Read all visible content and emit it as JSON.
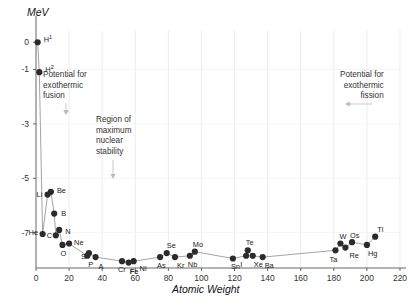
{
  "chart_data": {
    "type": "scatter",
    "title": "",
    "xlabel": "Atomic Weight",
    "ylabel": "MeV",
    "xlim": [
      0,
      220
    ],
    "ylim": [
      -8.3,
      0.45
    ],
    "xticks": [
      0,
      20,
      40,
      60,
      80,
      100,
      120,
      140,
      160,
      180,
      200,
      220
    ],
    "yticks": [
      0,
      -1,
      -3,
      -5,
      -7
    ],
    "ytick_labels": [
      "0",
      "-1",
      "-3",
      "-5",
      "-7"
    ],
    "grid": true,
    "legend": null,
    "line_color": "#9a9a9a",
    "marker_color": "#2b2b2b",
    "points": [
      {
        "label": "H",
        "sup": "1",
        "x": 1,
        "y": 0.0,
        "lx": 6,
        "ly": -4
      },
      {
        "label": "H",
        "sup": "2",
        "x": 2,
        "y": -1.1,
        "lx": 6,
        "ly": -4
      },
      {
        "label": "He",
        "x": 4,
        "y": -7.05,
        "lx": -14,
        "ly": -2
      },
      {
        "label": "Li",
        "x": 7,
        "y": -5.6,
        "lx": -11,
        "ly": -1
      },
      {
        "label": "Be",
        "x": 9,
        "y": -5.5,
        "lx": 6,
        "ly": -2
      },
      {
        "label": "B",
        "x": 11,
        "y": -6.3,
        "lx": 7,
        "ly": -1
      },
      {
        "label": "C",
        "x": 12,
        "y": -7.1,
        "lx": -9,
        "ly": 0
      },
      {
        "label": "N",
        "x": 14,
        "y": -6.9,
        "lx": 6,
        "ly": 1
      },
      {
        "label": "O",
        "x": 16,
        "y": -7.45,
        "lx": -2,
        "ly": 8
      },
      {
        "label": "Ne",
        "x": 20,
        "y": -7.4,
        "lx": 5,
        "ly": -2
      },
      {
        "label": "S",
        "x": 32,
        "y": -7.75,
        "lx": -8,
        "ly": 3
      },
      {
        "label": "P",
        "x": 31,
        "y": -7.85,
        "lx": 1,
        "ly": 8
      },
      {
        "label": "A",
        "x": 36,
        "y": -7.9,
        "lx": 3,
        "ly": 9
      },
      {
        "label": "Cr",
        "x": 52,
        "y": -8.05,
        "lx": -4,
        "ly": 8
      },
      {
        "label": "Fe",
        "x": 56,
        "y": -8.1,
        "lx": 1,
        "ly": 8,
        "bold": true
      },
      {
        "label": "Ni",
        "x": 59,
        "y": -8.05,
        "lx": 6,
        "ly": 7
      },
      {
        "label": "Se",
        "x": 79,
        "y": -7.75,
        "lx": 0,
        "ly": -8
      },
      {
        "label": "As",
        "x": 75,
        "y": -7.9,
        "lx": -3,
        "ly": 8
      },
      {
        "label": "Kr",
        "x": 84,
        "y": -7.9,
        "lx": 2,
        "ly": 8
      },
      {
        "label": "Mo",
        "x": 96,
        "y": -7.7,
        "lx": -2,
        "ly": -8
      },
      {
        "label": "Nb",
        "x": 93,
        "y": -7.85,
        "lx": -2,
        "ly": 8
      },
      {
        "label": "Te",
        "x": 128,
        "y": -7.65,
        "lx": -2,
        "ly": -8
      },
      {
        "label": "Sn",
        "x": 119,
        "y": -7.95,
        "lx": -2,
        "ly": 8
      },
      {
        "label": "I",
        "x": 127,
        "y": -7.85,
        "lx": -6,
        "ly": 8
      },
      {
        "label": "Xe",
        "x": 131,
        "y": -7.85,
        "lx": 1,
        "ly": 8
      },
      {
        "label": "Ba",
        "x": 137,
        "y": -7.9,
        "lx": 2,
        "ly": 8
      },
      {
        "label": "Ta",
        "x": 181,
        "y": -7.65,
        "lx": -6,
        "ly": 9
      },
      {
        "label": "W",
        "x": 184,
        "y": -7.4,
        "lx": -1,
        "ly": -8
      },
      {
        "label": "Re",
        "x": 187,
        "y": -7.55,
        "lx": 4,
        "ly": 7
      },
      {
        "label": "Os",
        "x": 191,
        "y": -7.35,
        "lx": -2,
        "ly": -7
      },
      {
        "label": "Hg",
        "x": 200,
        "y": -7.45,
        "lx": 1,
        "ly": 8
      },
      {
        "label": "Tl",
        "x": 205,
        "y": -7.15,
        "lx": 2,
        "ly": -8
      }
    ],
    "annotations": [
      {
        "name": "fusion",
        "lines": [
          "Potential for",
          "exothermic",
          "fusion"
        ],
        "leader": "arrow-down"
      },
      {
        "name": "stability",
        "lines": [
          "Region of",
          "maximum",
          "nuclear",
          "stability"
        ],
        "leader": "line-down"
      },
      {
        "name": "fission",
        "lines": [
          "Potential for",
          "exothermic",
          "fission"
        ],
        "leader": "arrow-left"
      }
    ]
  }
}
